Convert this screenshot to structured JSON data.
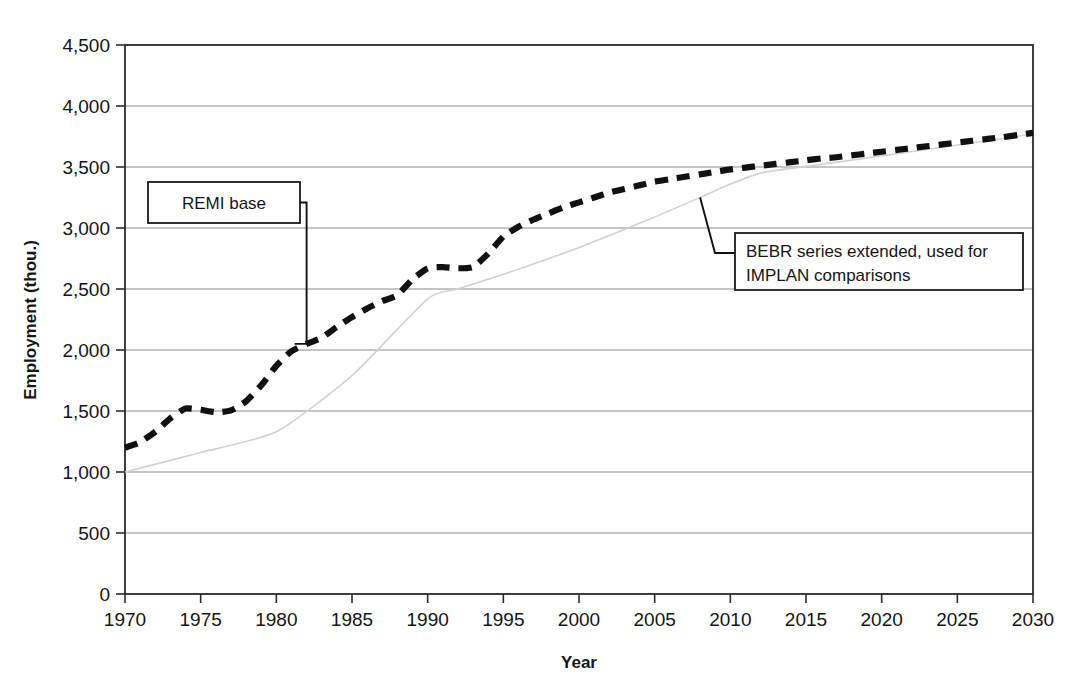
{
  "chart_data": {
    "type": "line",
    "title": "",
    "xlabel": "Year",
    "ylabel": "Employment (thou.)",
    "xlim": [
      1970,
      2030
    ],
    "ylim": [
      0,
      4500
    ],
    "grid": true,
    "legend_position": "none",
    "x_ticks": [
      1970,
      1975,
      1980,
      1985,
      1990,
      1995,
      2000,
      2005,
      2010,
      2015,
      2020,
      2025,
      2030
    ],
    "x_tick_labels": [
      "1970",
      "1975",
      "1980",
      "1985",
      "1990",
      "1995",
      "2000",
      "2005",
      "2010",
      "2015",
      "2020",
      "2025",
      "2030"
    ],
    "y_ticks": [
      0,
      500,
      1000,
      1500,
      2000,
      2500,
      3000,
      3500,
      4000,
      4500
    ],
    "y_tick_labels": [
      "0",
      "500",
      "1,000",
      "1,500",
      "2,000",
      "2,500",
      "3,000",
      "3,500",
      "4,000",
      "4,500"
    ],
    "series": [
      {
        "name": "REMI base",
        "style": "dashed",
        "color": "#111111",
        "x": [
          1970,
          1971,
          1972,
          1973,
          1974,
          1975,
          1976,
          1977,
          1978,
          1979,
          1980,
          1981,
          1982,
          1983,
          1984,
          1985,
          1986,
          1987,
          1988,
          1989,
          1990,
          1991,
          1992,
          1993,
          1994,
          1995,
          1996,
          1997,
          1998,
          1999,
          2000,
          2001,
          2002,
          2003,
          2004,
          2005,
          2006,
          2007,
          2008,
          2009,
          2010,
          2011,
          2012,
          2013,
          2014,
          2015,
          2016,
          2017,
          2018,
          2019,
          2020,
          2021,
          2022,
          2023,
          2024,
          2025,
          2026,
          2027,
          2028,
          2029,
          2030
        ],
        "values": [
          1200,
          1245,
          1330,
          1440,
          1520,
          1510,
          1490,
          1505,
          1580,
          1710,
          1870,
          1990,
          2050,
          2100,
          2190,
          2270,
          2340,
          2400,
          2450,
          2580,
          2670,
          2680,
          2670,
          2680,
          2790,
          2930,
          3010,
          3070,
          3120,
          3170,
          3210,
          3250,
          3290,
          3320,
          3350,
          3380,
          3400,
          3420,
          3440,
          3460,
          3480,
          3495,
          3510,
          3525,
          3540,
          3555,
          3570,
          3580,
          3595,
          3610,
          3625,
          3640,
          3655,
          3670,
          3685,
          3700,
          3715,
          3730,
          3745,
          3762,
          3780
        ]
      },
      {
        "name": "BEBR series extended, used for IMPLAN comparisons",
        "style": "solid",
        "color": "#d2d2d2",
        "x": [
          1970,
          1975,
          1980,
          1985,
          1990,
          1992,
          1995,
          2000,
          2005,
          2008,
          2010,
          2012,
          2015,
          2020,
          2025,
          2030
        ],
        "values": [
          1000,
          1160,
          1330,
          1790,
          2420,
          2500,
          2620,
          2840,
          3090,
          3250,
          3360,
          3450,
          3505,
          3590,
          3680,
          3770
        ]
      }
    ],
    "annotations": [
      {
        "id": "remi-base",
        "text_lines": [
          "REMI base"
        ],
        "points_to_year": 1982,
        "points_to_value": 2050
      },
      {
        "id": "bebr-extended",
        "text_lines": [
          "BEBR series extended, used for",
          "IMPLAN comparisons"
        ],
        "points_to_year": 2008,
        "points_to_value": 3250
      }
    ]
  },
  "colors": {
    "remi_series": "#111111",
    "bebr_series": "#d2d2d2",
    "gridline": "#8c8c8c",
    "frame": "#2b2b2b",
    "text": "#151515",
    "background": "#ffffff"
  }
}
